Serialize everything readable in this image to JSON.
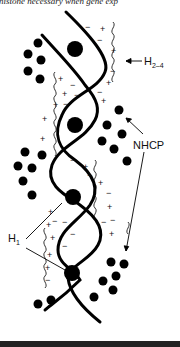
{
  "header": {
    "caption_fragment": "H1 and histone necessary when gene exp"
  },
  "diagram": {
    "labels": {
      "h24": "H",
      "h24_sub": "2–4",
      "nhcp": "NHCP",
      "h1": "H",
      "h1_sub": "1"
    },
    "charges": {
      "plus": "+",
      "minus": "−"
    }
  }
}
